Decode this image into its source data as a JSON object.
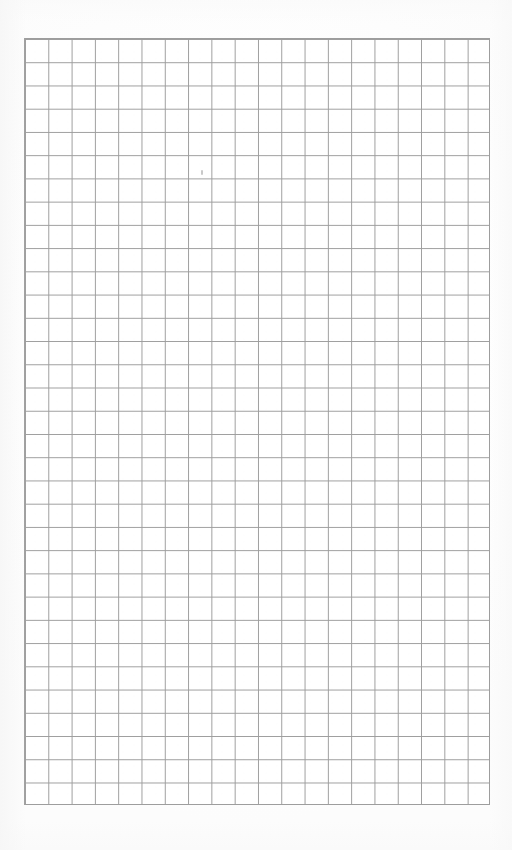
{
  "document": {
    "kind": "grid-paper-scan",
    "title": "Blank grid paper sheet",
    "page_width": 512,
    "page_height": 850,
    "background_color": "#ffffff",
    "text_content": "",
    "visible_labels": []
  },
  "grid": {
    "name": "graph-paper-grid",
    "columns": 20,
    "rows": 33,
    "cell_width": 23.3,
    "cell_height": 23.25,
    "left": 24,
    "top": 38,
    "width": 466,
    "height": 767,
    "line_color": "#9d9d9d",
    "line_width": 1.4,
    "border_color": "#9d9d9d",
    "border_width": 1.6,
    "cell_fill": "#ffffff"
  },
  "marks": {
    "stray_dot": {
      "name": "stray-pencil-mark",
      "x": 201,
      "y": 170,
      "width": 2,
      "height": 5,
      "color": "#bfbfbf"
    }
  },
  "margins": {
    "left": 24,
    "right": 22,
    "top": 38,
    "bottom": 45
  }
}
